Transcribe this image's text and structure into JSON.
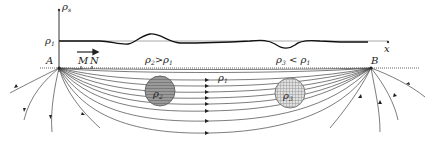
{
  "axes": {
    "y_label": "ρ",
    "y_label_sub": "s",
    "x_label": "x",
    "baseline_label": "ρ",
    "baseline_label_sub": "1"
  },
  "electrodes": {
    "left": "A",
    "right": "B"
  },
  "measurement": {
    "m_label": "M",
    "n_label": "N",
    "arrow": "direction-arrow"
  },
  "regions": {
    "left_condition": {
      "rho": "ρ",
      "sub": "2",
      "rel": ">",
      "rho2": "ρ",
      "sub2": "1"
    },
    "right_condition": {
      "rho": "ρ",
      "sub": "3",
      "rel": "<",
      "rho2": "ρ",
      "sub2": "1"
    },
    "medium_label": {
      "rho": "ρ",
      "sub": "1"
    }
  },
  "bodies": [
    {
      "name": "sphere-rho2",
      "label": "ρ",
      "sub": "2",
      "fill": "#9a9a9a"
    },
    {
      "name": "sphere-rho3",
      "label": "ρ",
      "sub": "3",
      "fill": "#d8d8d8"
    }
  ],
  "colors": {
    "line": "#333333",
    "ground": "#555555",
    "curve": "#111111"
  }
}
